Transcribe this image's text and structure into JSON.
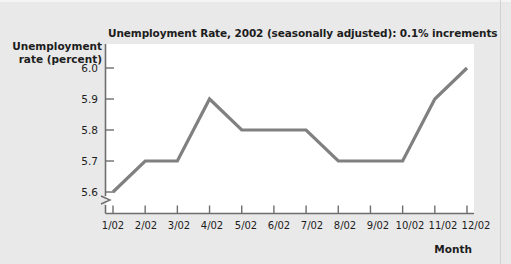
{
  "chart_data": {
    "type": "line",
    "title": "Unemployment Rate, 2002 (seasonally adjusted): 0.1% increments",
    "xlabel": "Month",
    "ylabel": "Unemployment rate (percent)",
    "categories": [
      "1/02",
      "2/02",
      "3/02",
      "4/02",
      "5/02",
      "6/02",
      "7/02",
      "8/02",
      "9/02",
      "10/02",
      "11/02",
      "12/02"
    ],
    "values": [
      5.6,
      5.7,
      5.7,
      5.9,
      5.8,
      5.8,
      5.8,
      5.7,
      5.7,
      5.7,
      5.9,
      6.0
    ],
    "ytick_labels": [
      "6.0",
      "5.9",
      "5.8",
      "5.7",
      "5.6"
    ],
    "ytick_values": [
      6.0,
      5.9,
      5.8,
      5.7,
      5.6
    ],
    "ylim": [
      5.6,
      6.0
    ],
    "y_axis_break": true,
    "grid": false,
    "legend": false,
    "line_color": "#808080",
    "axis_color": "#6e6e6e",
    "plot_background": "#ffffff",
    "page_background": "#e9e9e9",
    "text_color": "#1d1d1d",
    "series_name": "Unemployment rate"
  }
}
